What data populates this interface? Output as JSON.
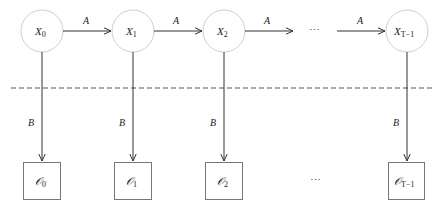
{
  "diagram": {
    "type": "hidden-markov-model",
    "colors": {
      "state_stroke": "#cfcfcf",
      "obs_stroke": "#777777",
      "edge": "#333333",
      "divider": "#555555"
    },
    "states": [
      {
        "id": "x0",
        "base": "X",
        "sub": "0",
        "cx": 42
      },
      {
        "id": "x1",
        "base": "X",
        "sub": "1",
        "cx": 133
      },
      {
        "id": "x2",
        "base": "X",
        "sub": "2",
        "cx": 224
      },
      {
        "id": "xT1",
        "base": "X",
        "sub": "T−1",
        "cx": 407
      }
    ],
    "observations": [
      {
        "id": "o0",
        "base": "𝒪",
        "sub": "0"
      },
      {
        "id": "o1",
        "base": "𝒪",
        "sub": "1"
      },
      {
        "id": "o2",
        "base": "𝒪",
        "sub": "2"
      },
      {
        "id": "oT1",
        "base": "𝒪",
        "sub": "T−1"
      }
    ],
    "transition_label": "A",
    "emission_label": "B",
    "ellipsis": "⋯"
  }
}
